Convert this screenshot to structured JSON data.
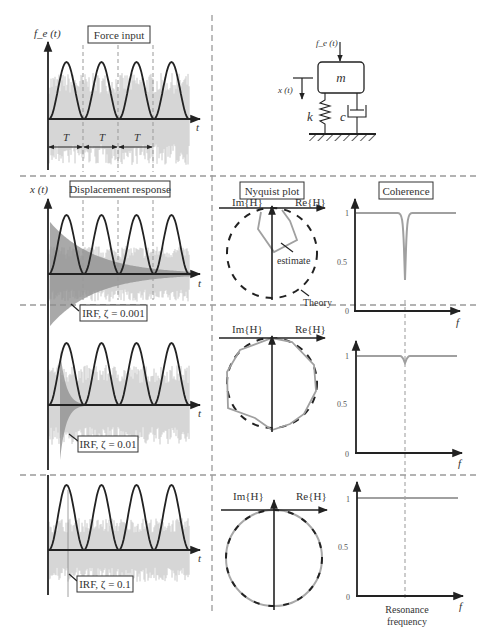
{
  "figure": {
    "panels": {
      "force": {
        "title": "Force input",
        "y_label": "f_e (t)",
        "x_label": "t",
        "period_label": "T",
        "period_count": 3
      },
      "model": {
        "force_label": "f_e (t)",
        "disp_label": "x (t)",
        "mass_label": "m",
        "spring_label": "k",
        "damper_label": "c"
      },
      "response": {
        "title": "Displacement response",
        "y_label": "x (t)",
        "x_label": "t",
        "rows": [
          {
            "irf_label": "IRF, ζ = 0.001",
            "zeta": 0.001
          },
          {
            "irf_label": "IRF, ζ = 0.01",
            "zeta": 0.01
          },
          {
            "irf_label": "IRF, ζ = 0.1",
            "zeta": 0.1
          }
        ]
      },
      "nyquist": {
        "title": "Nyquist plot",
        "im_label": "Im{H}",
        "re_label": "Re{H}",
        "estimate_label": "estimate",
        "theory_label": "Theory"
      },
      "coherence": {
        "title": "Coherence",
        "x_label": "f",
        "ticks": [
          "1",
          "0.5",
          "0"
        ],
        "resonance_label_1": "Resonance",
        "resonance_label_2": "frequency"
      }
    },
    "colors": {
      "axis": "#222222",
      "noise": "#c8c8c8",
      "noise_dark": "#8c8c8c",
      "estimate": "#a0a0a0",
      "divider": "#9a9a9a"
    }
  },
  "chart_data": [
    {
      "type": "line",
      "title": "Force input",
      "xlabel": "t",
      "ylabel": "f_e(t)",
      "series": [
        {
          "name": "periodic half-sine pulses",
          "periods": 4
        },
        {
          "name": "random noise",
          "description": "broadband grey noise"
        }
      ]
    },
    {
      "type": "line",
      "title": "Coherence",
      "xlabel": "f",
      "ylim": [
        0,
        1
      ],
      "yticks": [
        0,
        0.5,
        1
      ],
      "series": [
        {
          "name": "ζ = 0.001",
          "baseline": 1.0,
          "dip_min": 0.33,
          "dip_at": "resonance frequency"
        },
        {
          "name": "ζ = 0.01",
          "baseline": 1.0,
          "dip_min": 0.94,
          "dip_at": "resonance frequency"
        },
        {
          "name": "ζ = 0.1",
          "baseline": 1.0,
          "dip_min": 1.0,
          "dip_at": "none"
        }
      ]
    }
  ]
}
